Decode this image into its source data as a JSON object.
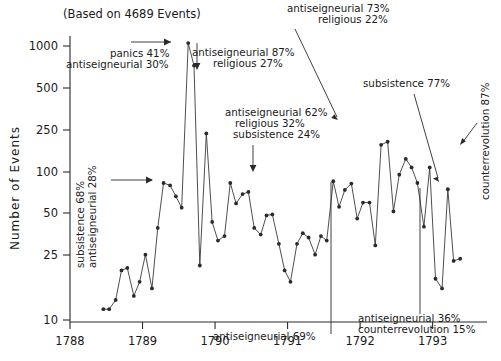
{
  "figure": {
    "title": "(Based on 4689 Events)",
    "ylabel": "Number of Events",
    "width": 501,
    "height": 361
  },
  "chart_data": {
    "type": "line",
    "title": "(Based on 4689 Events)",
    "xlabel": "",
    "ylabel": "Number of Events",
    "yscale": "log",
    "ylim": [
      10,
      1300
    ],
    "xlim": [
      1788.0,
      1793.75
    ],
    "grid": false,
    "legend": null,
    "yticks": [
      10,
      25,
      50,
      100,
      250,
      500,
      1000
    ],
    "ytick_labels": [
      "10",
      "25",
      "50",
      "100",
      "250",
      "500",
      "1000"
    ],
    "xticks": [
      1788,
      1789,
      1790,
      1791,
      1792,
      1793
    ],
    "xtick_labels": [
      "1788",
      "1789",
      "1790",
      "1791",
      "1792",
      "1793"
    ],
    "marker": "circle",
    "series": [
      {
        "name": "Number of Events",
        "x": [
          1788.46,
          1788.54,
          1788.63,
          1788.71,
          1788.79,
          1788.88,
          1788.96,
          1789.04,
          1789.13,
          1789.21,
          1789.29,
          1789.38,
          1789.46,
          1789.54,
          1789.63,
          1789.71,
          1789.79,
          1789.88,
          1789.96,
          1790.04,
          1790.13,
          1790.21,
          1790.29,
          1790.38,
          1790.46,
          1790.54,
          1790.63,
          1790.71,
          1790.79,
          1790.88,
          1790.96,
          1791.04,
          1791.13,
          1791.21,
          1791.29,
          1791.38,
          1791.46,
          1791.54,
          1791.63,
          1791.71,
          1791.79,
          1791.88,
          1791.96,
          1792.04,
          1792.13,
          1792.21,
          1792.29,
          1792.38,
          1792.46,
          1792.54,
          1792.63,
          1792.71,
          1792.79,
          1792.88,
          1792.96,
          1793.04,
          1793.13,
          1793.21,
          1793.29,
          1793.38
        ],
        "y": [
          12,
          12,
          14,
          23,
          24,
          15,
          19,
          30,
          17,
          47,
          100,
          96,
          80,
          66,
          1050,
          720,
          25,
          230,
          52,
          38,
          41,
          100,
          71,
          83,
          86,
          47,
          42,
          58,
          59,
          36,
          23,
          19,
          36,
          43,
          40,
          30,
          41,
          38,
          103,
          67,
          89,
          99,
          55,
          72,
          72,
          35,
          190,
          200,
          62,
          115,
          150,
          130,
          100,
          48,
          130,
          20,
          17,
          90,
          27,
          28
        ]
      }
    ],
    "annotations": [
      {
        "id": "panics",
        "lines": [
          "panics 41%",
          "antiseigneurial 30%"
        ],
        "pointer": "arrow-right"
      },
      {
        "id": "antiseig87",
        "lines": [
          "antiseigneurial 87%",
          "religious 27%"
        ],
        "pointer": "arrow-left"
      },
      {
        "id": "antiseig73",
        "lines": [
          "antiseigneurial 73%",
          "religious 22%"
        ],
        "pointer": "arrow-down-right"
      },
      {
        "id": "antiseig62",
        "lines": [
          "antiseigneurial 62%",
          "religious 32%",
          "subsistence 24%"
        ],
        "pointer": "arrow-down"
      },
      {
        "id": "subsistence77",
        "lines": [
          "subsistence 77%"
        ],
        "pointer": "arrow-down-right"
      },
      {
        "id": "subsistence68",
        "lines": [
          "subsistence 68%",
          "antiseigneurial 28%"
        ],
        "pointer": "arrow-right",
        "orientation": "vertical"
      },
      {
        "id": "counterrev87",
        "lines": [
          "counterrevolution 87%"
        ],
        "pointer": "arrow-down-left",
        "orientation": "vertical"
      },
      {
        "id": "antiseig69",
        "lines": [
          "antiseigneurial 69%"
        ],
        "pointer": "line-up"
      },
      {
        "id": "antiseig36",
        "lines": [
          "antiseigneurial 36%",
          "counterrevolution 15%"
        ],
        "pointer": "line-up"
      }
    ]
  }
}
